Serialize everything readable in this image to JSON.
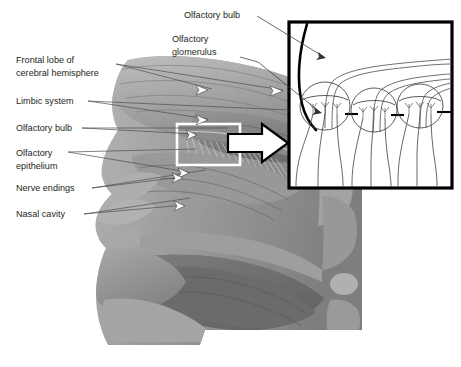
{
  "figure": {
    "background_color": "#ffffff",
    "width": 461,
    "height": 367
  },
  "labels": {
    "frontal_lobe_line1": "Frontal lobe of",
    "frontal_lobe_line2": "cerebral hemisphere",
    "limbic_system": "Limbic system",
    "olfactory_bulb": "Olfactory bulb",
    "olfactory_epithelium_line1": "Olfactory",
    "olfactory_epithelium_line2": "epithelium",
    "nerve_endings": "Nerve endings",
    "nasal_cavity": "Nasal cavity",
    "inset_olfactory_bulb": "Olfactory bulb",
    "inset_glomerulus_line1": "Olfactory",
    "inset_glomerulus_line2": "glomerulus"
  },
  "colors": {
    "text": "#231f20",
    "leader": "#4d4d4d",
    "inset_border": "#000000",
    "inset_background": "#ffffff",
    "anatomy_mid_gray": "#8e8e8e",
    "anatomy_light_gray": "#b4b4b4",
    "anatomy_dark_gray": "#5c5c5c",
    "selection_box": "#ffffff",
    "magnify_arrow_fill": "#ffffff"
  },
  "icons": {
    "selection_box": "white-rectangle-highlight",
    "magnify_arrow": "white-block-arrow-right",
    "pointer_arrowhead": "white-arrowhead"
  },
  "inset": {
    "glomerulus_count": 3,
    "nerve_fiber_count": 9,
    "axon_count": 3
  }
}
